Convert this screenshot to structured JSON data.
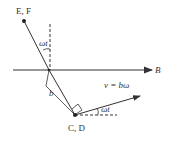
{
  "labels": {
    "top_point": "E, F",
    "bottom_point": "C, D",
    "field": "B",
    "angle_top": "ωt",
    "angle_bottom": "ωt",
    "length": "b",
    "velocity": "v = bω"
  },
  "colors": {
    "line": "#333333",
    "background": "#ffffff"
  }
}
